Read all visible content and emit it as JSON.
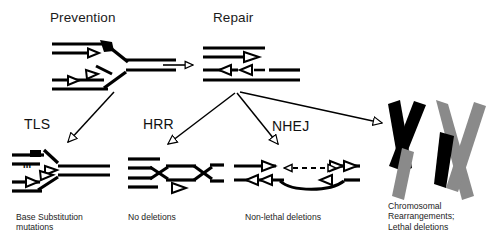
{
  "figure": {
    "background": "#ffffff",
    "ink": "#000000",
    "gray": "#8a8a8a",
    "title_prevention": "Prevention",
    "title_repair": "Repair"
  },
  "headers": [
    {
      "id": "prevention",
      "label": "Prevention",
      "x": 50,
      "y": 10
    },
    {
      "id": "repair",
      "label": "Repair",
      "x": 213,
      "y": 10
    }
  ],
  "pathways": [
    {
      "id": "tls",
      "label": "TLS",
      "x": 24,
      "y": 116
    },
    {
      "id": "hrr",
      "label": "HRR",
      "x": 143,
      "y": 116
    },
    {
      "id": "nhej",
      "label": "NHEJ",
      "x": 272,
      "y": 118
    }
  ],
  "outcomes": [
    {
      "id": "base-substitution",
      "lines": [
        "Base Substitution",
        "mutations"
      ],
      "x": 16,
      "y": 212
    },
    {
      "id": "no-deletions",
      "lines": [
        "No deletions"
      ],
      "x": 128,
      "y": 212
    },
    {
      "id": "non-lethal",
      "lines": [
        "Non-lethal deletions"
      ],
      "x": 245,
      "y": 212
    },
    {
      "id": "chromosomal",
      "lines": [
        "Chromosomal",
        "Rearrangements;",
        "Lethal deletions"
      ],
      "x": 388,
      "y": 201
    }
  ],
  "markers": [
    {
      "id": "mutation-marker",
      "label": "m",
      "x": 23,
      "y": 160
    }
  ],
  "structures": {
    "replication_fork": {
      "id": "replication-fork",
      "desc": "stalled replication fork with lesion"
    },
    "double_strand_break": {
      "id": "double-strand-break",
      "desc": "double strand break with resected ends"
    },
    "tls_product": {
      "id": "tls-product-fork",
      "desc": "fork bypassed with point mutation"
    },
    "hrr_product": {
      "id": "hrr-product-crossover",
      "desc": "crossed strand exchange, no deletion"
    },
    "nhej_product": {
      "id": "nhej-product-deletion",
      "desc": "rejoined ends with deleted span"
    },
    "chromosomes": {
      "id": "chromosome-pair",
      "desc": "two translocated metaphase chromosomes"
    }
  },
  "arrows": [
    {
      "id": "fork-to-dsb",
      "desc": "Prevention to Repair transition"
    },
    {
      "id": "arrow-tls",
      "desc": "fork to TLS product"
    },
    {
      "id": "arrow-hrr",
      "desc": "DSB to HRR product"
    },
    {
      "id": "arrow-nhej",
      "desc": "DSB to NHEJ product"
    },
    {
      "id": "arrow-chromo",
      "desc": "DSB to chromosomal rearrangements"
    },
    {
      "id": "deletion-span",
      "desc": "dashed double-headed deletion span"
    }
  ]
}
